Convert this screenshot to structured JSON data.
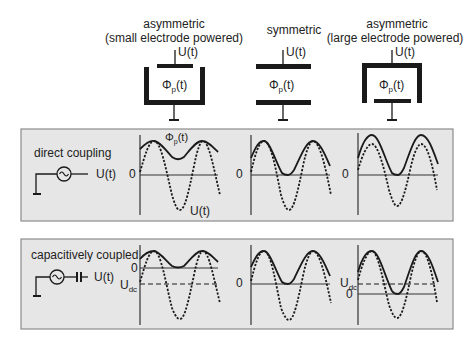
{
  "configurations": [
    {
      "title_line1": "asymmetric",
      "title_line2": "(small electrode powered)",
      "voltage_label": "U(t)",
      "potential_label": "Φ",
      "potential_sub": "p",
      "potential_tail": "(t)"
    },
    {
      "title_line1": "symmetric",
      "title_line2": "",
      "voltage_label": "U(t)",
      "potential_label": "Φ",
      "potential_sub": "p",
      "potential_tail": "(t)"
    },
    {
      "title_line1": "asymmetric",
      "title_line2": "(large electrode powered)",
      "voltage_label": "U(t)",
      "potential_label": "Φ",
      "potential_sub": "p",
      "potential_tail": "(t)"
    }
  ],
  "panels": {
    "direct": {
      "title": "direct coupling",
      "source_label": "U(t)",
      "zero_label": "0",
      "phi_label": "Φ",
      "phi_sub": "p",
      "phi_tail": "(t)",
      "u_label": "U(t)"
    },
    "capacitive": {
      "title": "capacitively coupled",
      "source_label": "U(t)",
      "zero_label": "0",
      "udc_label": "U",
      "udc_sub": "dc"
    }
  },
  "colors": {
    "panel_bg": "#e6e6e6",
    "panel_border": "#8c8c8c",
    "ink": "#222222"
  }
}
